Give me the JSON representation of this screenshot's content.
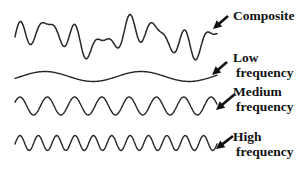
{
  "colors": {
    "background": "#ffffff",
    "line": "#262626",
    "text": "#111111"
  },
  "labels": [
    {
      "id": "composite",
      "lines": [
        "Composite"
      ]
    },
    {
      "id": "low",
      "lines": [
        "Low",
        "frequency"
      ]
    },
    {
      "id": "medium",
      "lines": [
        "Medium",
        "frequency"
      ]
    },
    {
      "id": "high",
      "lines": [
        "High",
        "frequency"
      ]
    }
  ],
  "chart_data": {
    "type": "line",
    "x_range_px": [
      15,
      217
    ],
    "waves": [
      {
        "id": "composite",
        "label": "Composite",
        "center_y": 37,
        "sum_of": [
          {
            "component": "low",
            "gain": 9
          },
          {
            "component": "medium",
            "gain": 10
          },
          {
            "component": "high",
            "gain": 6
          }
        ]
      },
      {
        "id": "low",
        "label": "Low frequency",
        "cycles": 2.1,
        "amplitude": 5,
        "phase": -0.38,
        "center_y": 76.5
      },
      {
        "id": "medium",
        "label": "Medium frequency",
        "cycles": 7.4,
        "amplitude": 9,
        "phase": 0.43,
        "center_y": 106
      },
      {
        "id": "high",
        "label": "High frequency",
        "cycles": 11,
        "amplitude": 7.5,
        "phase": -0.13,
        "center_y": 143
      }
    ]
  }
}
